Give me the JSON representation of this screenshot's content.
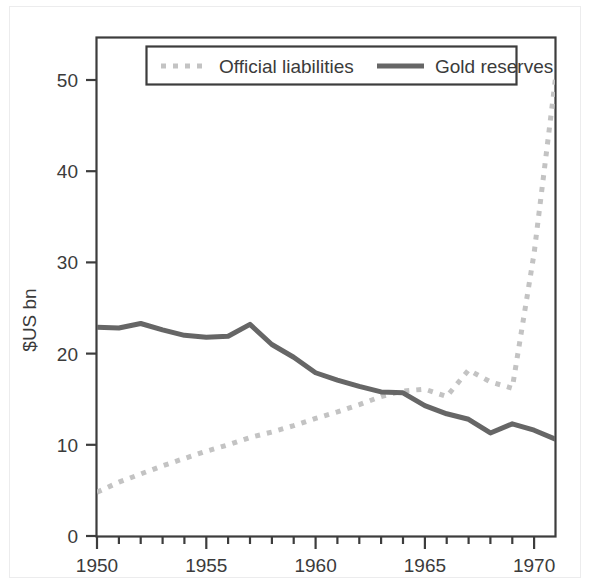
{
  "figure": {
    "name": "gold-reserves-vs-official-liabilities",
    "background_color": "#ffffff"
  },
  "chart_data": {
    "type": "line",
    "title": "",
    "subtitle": "",
    "xlabel": "",
    "ylabel": "$US bn",
    "xlim": [
      1950,
      1971
    ],
    "ylim": [
      0,
      55
    ],
    "grid": false,
    "legend_position": "top-center",
    "y_ticks": [
      0,
      10,
      20,
      30,
      40,
      50
    ],
    "y_tick_labels": [
      "0",
      "10",
      "20",
      "30",
      "40",
      "50"
    ],
    "x_ticks": [
      1950,
      1951,
      1952,
      1953,
      1954,
      1955,
      1956,
      1957,
      1958,
      1959,
      1960,
      1961,
      1962,
      1963,
      1964,
      1965,
      1966,
      1967,
      1968,
      1969,
      1970,
      1971
    ],
    "x_tick_labels_shown": [
      "1950",
      "1955",
      "1960",
      "1965",
      "1970"
    ],
    "x_labeled_ticks": [
      1950,
      1955,
      1960,
      1965,
      1970
    ],
    "x": [
      1950,
      1951,
      1952,
      1953,
      1954,
      1955,
      1956,
      1957,
      1958,
      1959,
      1960,
      1961,
      1962,
      1963,
      1964,
      1965,
      1966,
      1967,
      1968,
      1969,
      1970,
      1971
    ],
    "series": [
      {
        "name": "Official liabilities",
        "style": "dotted",
        "color": "#c3c3c3",
        "line_width": 5,
        "values": [
          4.8,
          5.9,
          6.8,
          7.7,
          8.5,
          9.3,
          10.0,
          10.8,
          11.4,
          12.1,
          12.9,
          13.6,
          14.4,
          15.3,
          15.9,
          16.1,
          15.3,
          18.2,
          16.9,
          16.2,
          31.0,
          50.6
        ]
      },
      {
        "name": "Gold reserves",
        "style": "solid",
        "color": "#666666",
        "line_width": 5,
        "values": [
          22.9,
          22.8,
          23.3,
          22.6,
          22.0,
          21.8,
          21.9,
          23.2,
          21.0,
          19.6,
          17.9,
          17.1,
          16.4,
          15.8,
          15.7,
          14.3,
          13.4,
          12.8,
          11.3,
          12.3,
          11.6,
          10.6
        ]
      }
    ]
  },
  "axes": {
    "y_axis_title": "$US bn",
    "y_tick_0": "0",
    "y_tick_10": "10",
    "y_tick_20": "20",
    "y_tick_30": "30",
    "y_tick_40": "40",
    "y_tick_50": "50",
    "x_tick_1950": "1950",
    "x_tick_1955": "1955",
    "x_tick_1960": "1960",
    "x_tick_1965": "1965",
    "x_tick_1970": "1970",
    "frame_color": "#3d3d3d"
  },
  "legend": {
    "entries": [
      {
        "label": "Official liabilities",
        "swatch": "dotted-line-swatch",
        "color": "#c3c3c3"
      },
      {
        "label": "Gold reserves",
        "swatch": "solid-line-swatch",
        "color": "#666666"
      }
    ],
    "border_color": "#3d3d3d",
    "background_color": "#ffffff"
  }
}
